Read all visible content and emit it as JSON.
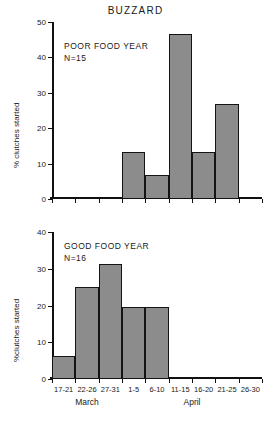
{
  "chart_data": {
    "type": "bar",
    "title": "BUZZARD",
    "xlabel": "",
    "ylabel": "% clutches started",
    "grid": false,
    "legend_position": "none",
    "categories": [
      "17-21",
      "22-26",
      "27-31",
      "1-5",
      "6-10",
      "11-15",
      "16-20",
      "21-25",
      "26-30"
    ],
    "month_groups": [
      {
        "label": "March",
        "categories": [
          "17-21",
          "22-26",
          "27-31"
        ]
      },
      {
        "label": "April",
        "categories": [
          "1-5",
          "6-10",
          "11-15",
          "16-20",
          "21-25",
          "26-30"
        ]
      }
    ],
    "panels": [
      {
        "name": "poor-food-year",
        "annotation_line1": "POOR FOOD YEAR",
        "annotation_line2": "N=15",
        "ylabel": "% clutches started",
        "ylim": [
          0,
          50
        ],
        "yticks": [
          0,
          10,
          20,
          30,
          40,
          50
        ],
        "values": [
          0,
          0,
          0,
          13.3,
          6.7,
          46.7,
          13.3,
          26.7,
          0
        ]
      },
      {
        "name": "good-food-year",
        "annotation_line1": "GOOD FOOD YEAR",
        "annotation_line2": "N=16",
        "ylabel": "%clutches started",
        "ylim": [
          0,
          40
        ],
        "yticks": [
          0,
          10,
          20,
          30,
          40
        ],
        "values": [
          6.25,
          25.0,
          31.25,
          19.5,
          19.5,
          0,
          0,
          0,
          0
        ]
      }
    ],
    "colors": {
      "bar_fill": "#8c8c8c",
      "bar_stroke": "#141414",
      "axis": "#111111",
      "text": "#1a1a1a",
      "background": "#ffffff"
    }
  }
}
